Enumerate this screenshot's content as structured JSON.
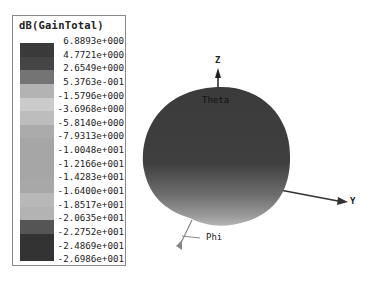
{
  "legend": {
    "title": "dB(GainTotal)",
    "labels": [
      "6.8893e+000",
      "4.7721e+000",
      "2.6549e+000",
      "5.3763e-001",
      "-1.5796e+000",
      "-3.6968e+000",
      "-5.8140e+000",
      "-7.9313e+000",
      "-1.0048e+001",
      "-1.2166e+001",
      "-1.4283e+001",
      "-1.6400e+001",
      "-1.8517e+001",
      "-2.0635e+001",
      "-2.2752e+001",
      "-2.4869e+001",
      "-2.6986e+001"
    ],
    "colors": [
      "#3a3a3a",
      "#454545",
      "#747474",
      "#b3b3b3",
      "#cbcbcb",
      "#bdbdbd",
      "#ababab",
      "#a6a6a6",
      "#a6a6a6",
      "#a6a6a6",
      "#a8a8a8",
      "#b8b8b8",
      "#b3b3b3",
      "#555555",
      "#333333",
      "#333333"
    ]
  },
  "plot": {
    "axes": {
      "z_label": "Z",
      "y_label": "Y",
      "theta_label": "Theta",
      "phi_label": "Phi"
    },
    "sphere_top_color": "#3b3b3b",
    "sphere_bottom_color": "#9a9a9a"
  }
}
